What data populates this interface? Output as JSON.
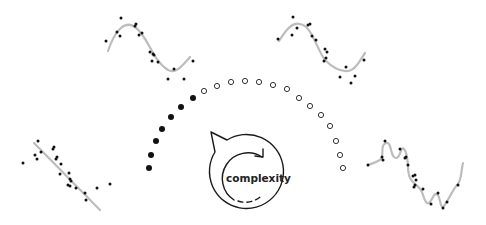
{
  "center_icon": {
    "label": "complexity",
    "stroke": "#1a1a1a"
  },
  "colors": {
    "points": "#111111",
    "fit_curve": "#bdbdbd",
    "arc_filled": "#111111",
    "arc_hollow": "#333333"
  },
  "arc": {
    "filled_dots": [
      [
        149,
        168
      ],
      [
        151,
        155
      ],
      [
        156,
        141
      ],
      [
        162,
        129
      ],
      [
        171,
        117
      ],
      [
        181,
        107
      ],
      [
        193,
        98
      ]
    ],
    "hollow_dots": [
      [
        204,
        91
      ],
      [
        217,
        86
      ],
      [
        231,
        82
      ],
      [
        245,
        81
      ],
      [
        259,
        82
      ],
      [
        273,
        85
      ],
      [
        287,
        89
      ],
      [
        299,
        98
      ],
      [
        310,
        106
      ],
      [
        321,
        115
      ],
      [
        330,
        126
      ],
      [
        336,
        141
      ],
      [
        340,
        155
      ],
      [
        343,
        168
      ]
    ]
  },
  "panels": [
    {
      "name": "underfit-linear",
      "curve": "M34,143 L100,210",
      "points": [
        [
          23,
          163
        ],
        [
          38,
          141
        ],
        [
          35,
          155
        ],
        [
          37,
          159
        ],
        [
          41,
          152
        ],
        [
          53,
          149
        ],
        [
          54,
          147
        ],
        [
          56,
          159
        ],
        [
          57,
          157
        ],
        [
          61,
          164
        ],
        [
          60,
          174
        ],
        [
          69,
          173
        ],
        [
          70,
          179
        ],
        [
          71,
          181
        ],
        [
          70,
          186
        ],
        [
          68,
          185
        ],
        [
          76,
          188
        ],
        [
          85,
          193
        ],
        [
          86,
          200
        ],
        [
          97,
          188
        ],
        [
          110,
          184
        ]
      ]
    },
    {
      "name": "good-fit-left",
      "curve": "M108,51 C115,30 125,20 135,27 C148,36 152,60 168,70 C176,74 182,66 190,57",
      "points": [
        [
          106,
          41
        ],
        [
          121,
          18
        ],
        [
          117,
          32
        ],
        [
          120,
          36
        ],
        [
          135,
          26
        ],
        [
          136,
          24
        ],
        [
          139,
          35
        ],
        [
          142,
          33
        ],
        [
          150,
          52
        ],
        [
          154,
          55
        ],
        [
          153,
          54
        ],
        [
          152,
          61
        ],
        [
          158,
          62
        ],
        [
          174,
          69
        ],
        [
          168,
          79
        ],
        [
          184,
          79
        ],
        [
          193,
          61
        ]
      ]
    },
    {
      "name": "good-fit-right",
      "curve": "M279,41 C286,30 292,22 300,24 C312,26 316,48 325,60 C333,68 340,72 348,71 C356,70 360,60 365,53",
      "points": [
        [
          278,
          39
        ],
        [
          293,
          17
        ],
        [
          297,
          28
        ],
        [
          292,
          35
        ],
        [
          308,
          25
        ],
        [
          310,
          24
        ],
        [
          312,
          36
        ],
        [
          316,
          40
        ],
        [
          325,
          49
        ],
        [
          327,
          52
        ],
        [
          326,
          58
        ],
        [
          324,
          61
        ],
        [
          346,
          67
        ],
        [
          340,
          77
        ],
        [
          355,
          76
        ],
        [
          351,
          83
        ],
        [
          364,
          60
        ]
      ]
    },
    {
      "name": "overfit-wiggly",
      "curve": "M368,165 C375,162 379,162 382,158 C383,150 381,145 386,143 C392,141 390,158 396,158 C401,158 400,146 404,149 C410,156 406,170 410,178 C413,184 418,185 421,190 C424,196 425,205 429,203 C434,198 433,192 438,195 C441,200 440,209 444,206 C450,198 452,190 458,184 C462,178 461,170 463,163",
      "points": [
        [
          368,
          165
        ],
        [
          385,
          141
        ],
        [
          382,
          157
        ],
        [
          383,
          160
        ],
        [
          400,
          149
        ],
        [
          405,
          158
        ],
        [
          406,
          157
        ],
        [
          408,
          165
        ],
        [
          413,
          176
        ],
        [
          415,
          175
        ],
        [
          416,
          180
        ],
        [
          415,
          185
        ],
        [
          414,
          187
        ],
        [
          423,
          189
        ],
        [
          438,
          193
        ],
        [
          431,
          204
        ],
        [
          443,
          208
        ],
        [
          447,
          202
        ],
        [
          458,
          185
        ]
      ]
    }
  ]
}
